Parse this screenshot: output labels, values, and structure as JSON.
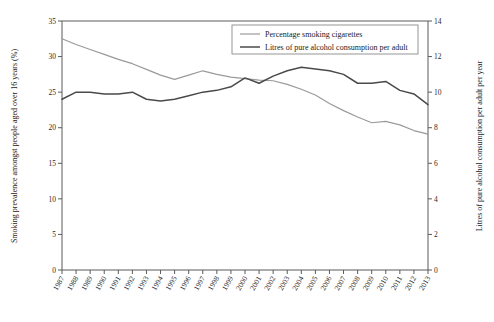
{
  "chart_data": {
    "type": "line",
    "title": "",
    "xlabel": "",
    "ylabel": "Smoking prevalence amongst people aged over 16 years (%)",
    "y2label": "Litres of pure alcohol consumption per adult per year",
    "ylim": [
      0,
      35
    ],
    "y2lim": [
      0,
      14
    ],
    "yticks": [
      "0",
      "5",
      "10",
      "15",
      "20",
      "25",
      "30",
      "35"
    ],
    "y2ticks": [
      "0",
      "2",
      "4",
      "6",
      "8",
      "10",
      "12",
      "14"
    ],
    "grid": false,
    "legend_position": "top-right",
    "categories": [
      "1987",
      "1988",
      "1989",
      "1990",
      "1991",
      "1992",
      "1993",
      "1994",
      "1995",
      "1996",
      "1997",
      "1998",
      "1999",
      "2000",
      "2001",
      "2002",
      "2003",
      "2004",
      "2005",
      "2006",
      "2007",
      "2008",
      "2009",
      "2010",
      "2011",
      "2012",
      "2013"
    ],
    "series": [
      {
        "name": "Percentage smoking cigarettes",
        "axis": "left",
        "unit": "%",
        "color": "#9a9a9a",
        "values": [
          32.5,
          31.7,
          31.0,
          30.3,
          29.6,
          29.0,
          28.2,
          27.4,
          26.8,
          27.4,
          28.0,
          27.5,
          27.1,
          26.9,
          26.7,
          26.6,
          26.1,
          25.4,
          24.6,
          23.4,
          22.4,
          21.5,
          20.7,
          20.9,
          20.4,
          19.6,
          19.1
        ]
      },
      {
        "name": "Litres of pure alcohol consumption per adult",
        "axis": "right",
        "unit": "litres",
        "color": "#4a4a4a",
        "values": [
          9.6,
          10.0,
          10.0,
          9.9,
          9.9,
          10.0,
          9.6,
          9.5,
          9.6,
          9.8,
          10.0,
          10.1,
          10.3,
          10.8,
          10.5,
          10.9,
          11.2,
          11.4,
          11.3,
          11.2,
          11.0,
          10.5,
          10.5,
          10.6,
          10.1,
          9.9,
          9.3
        ]
      }
    ]
  },
  "legend": {
    "entries": [
      {
        "label": "Percentage smoking cigarettes"
      },
      {
        "label": "Litres of pure alcohol consumption per adult"
      }
    ]
  }
}
